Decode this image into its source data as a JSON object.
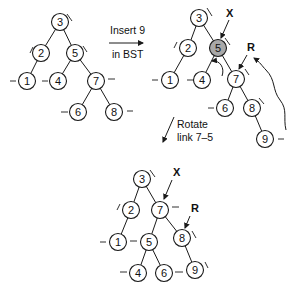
{
  "diagram": {
    "steps": [
      {
        "label_line1": "Insert 9",
        "label_line2": "in BST"
      },
      {
        "label_line1": "Rotate",
        "label_line2": "link 7–5"
      }
    ],
    "pointers": {
      "x": "X",
      "r": "R"
    },
    "trees": [
      {
        "name": "before-insert",
        "nodes": [
          {
            "key": "3"
          },
          {
            "key": "2"
          },
          {
            "key": "5"
          },
          {
            "key": "1"
          },
          {
            "key": "4"
          },
          {
            "key": "7"
          },
          {
            "key": "6"
          },
          {
            "key": "8"
          }
        ]
      },
      {
        "name": "after-insert",
        "nodes": [
          {
            "key": "3"
          },
          {
            "key": "2"
          },
          {
            "key": "5",
            "highlighted": true
          },
          {
            "key": "1"
          },
          {
            "key": "4"
          },
          {
            "key": "7"
          },
          {
            "key": "6"
          },
          {
            "key": "8"
          },
          {
            "key": "9"
          }
        ]
      },
      {
        "name": "after-rotate",
        "nodes": [
          {
            "key": "3"
          },
          {
            "key": "2"
          },
          {
            "key": "7"
          },
          {
            "key": "1"
          },
          {
            "key": "5"
          },
          {
            "key": "8"
          },
          {
            "key": "4"
          },
          {
            "key": "6"
          },
          {
            "key": "9"
          }
        ]
      }
    ]
  }
}
